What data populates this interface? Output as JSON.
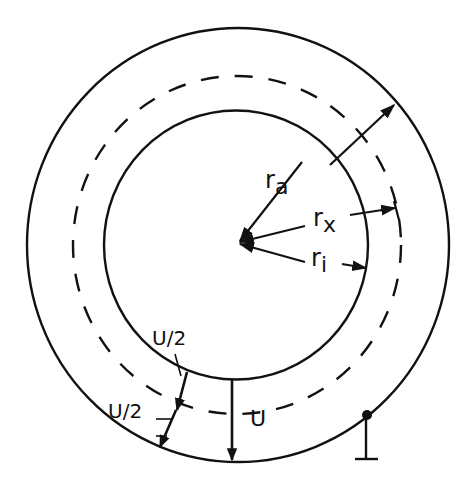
{
  "diagram": {
    "type": "coaxial-cross-section",
    "colors": {
      "stroke": "#111111",
      "background": "#ffffff"
    },
    "labels": {
      "r_outer_main": "r",
      "r_outer_sub": "a",
      "r_x_main": "r",
      "r_x_sub": "x",
      "r_inner_main": "r",
      "r_inner_sub": "i",
      "half_voltage_top": "U/2",
      "half_voltage_bottom": "U/2",
      "voltage": "U"
    },
    "elements": {
      "outer_conductor": "solid circle, radius r_a",
      "inner_conductor": "solid circle, radius r_i",
      "equipotential": "dashed circle, radius r_x",
      "ground_symbol": "ground connection on outer conductor"
    }
  }
}
